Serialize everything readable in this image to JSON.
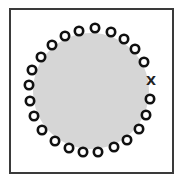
{
  "diagram": {
    "frame": {
      "border_color": "#3a3a3a"
    },
    "disc": {
      "cx": 91,
      "cy": 91,
      "r": 58,
      "fill": "#d6d6d6"
    },
    "ring": {
      "stroke": "#111111",
      "bead_count": 23,
      "beads": [
        [
          95,
          28
        ],
        [
          111,
          32
        ],
        [
          124,
          39
        ],
        [
          135,
          49
        ],
        [
          144,
          62
        ],
        [
          150,
          99
        ],
        [
          146,
          115
        ],
        [
          139,
          129
        ],
        [
          127,
          140
        ],
        [
          114,
          147
        ],
        [
          98,
          152
        ],
        [
          83,
          152
        ],
        [
          69,
          148
        ],
        [
          55,
          141
        ],
        [
          42,
          130
        ],
        [
          34,
          116
        ],
        [
          30,
          101
        ],
        [
          29,
          85
        ],
        [
          32,
          70
        ],
        [
          41,
          57
        ],
        [
          52,
          45
        ],
        [
          65,
          36
        ],
        [
          79,
          31
        ]
      ]
    },
    "marker": {
      "label": "X",
      "x": 151,
      "y": 81
    }
  }
}
